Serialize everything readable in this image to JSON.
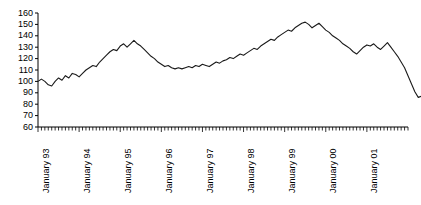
{
  "chart_data": {
    "type": "line",
    "title": "",
    "subtitle": "",
    "xlabel": "",
    "ylabel": "",
    "ylim": [
      60,
      160
    ],
    "ytick_step": 10,
    "yticks": [
      60,
      70,
      80,
      90,
      100,
      110,
      120,
      130,
      140,
      150,
      160
    ],
    "grid": false,
    "legend": null,
    "legend_position": "none",
    "line_color": "#1a1a1a",
    "axis_color": "#000000",
    "x_minor_ticks": "monthly",
    "x_tick_labels": [
      "January 93",
      "January 94",
      "January 95",
      "January 96",
      "January 97",
      "January 98",
      "January 99",
      "January 00",
      "January 01"
    ],
    "x_tick_label_index": [
      0,
      12,
      24,
      36,
      48,
      60,
      72,
      84,
      96
    ],
    "x_start": "January 93",
    "x_count": 109,
    "series": [
      {
        "name": "index",
        "values": [
          100,
          102,
          100,
          97,
          96,
          100,
          103,
          101,
          105,
          103,
          107,
          106,
          104,
          107,
          110,
          112,
          114,
          113,
          117,
          120,
          123,
          126,
          128,
          127,
          131,
          133,
          130,
          133,
          136,
          133,
          131,
          128,
          125,
          122,
          120,
          117,
          115,
          113,
          114,
          112,
          111,
          112,
          111,
          112,
          113,
          112,
          114,
          113,
          115,
          114,
          113,
          115,
          117,
          116,
          118,
          119,
          121,
          120,
          122,
          124,
          123,
          125,
          127,
          129,
          128,
          131,
          133,
          135,
          137,
          136,
          139,
          141,
          143,
          145,
          144,
          147,
          149,
          151,
          152,
          150,
          147,
          149,
          151,
          148,
          145,
          143,
          140,
          138,
          136,
          133,
          131,
          129,
          126,
          124,
          127,
          130,
          132,
          131,
          133,
          130,
          128,
          131,
          134,
          130,
          126,
          122,
          117,
          112,
          105,
          98,
          91,
          86,
          87
        ]
      }
    ]
  },
  "axis": {
    "ytick_labels": [
      "160",
      "150",
      "140",
      "130",
      "120",
      "110",
      "100",
      "90",
      "80",
      "70",
      "60"
    ]
  }
}
